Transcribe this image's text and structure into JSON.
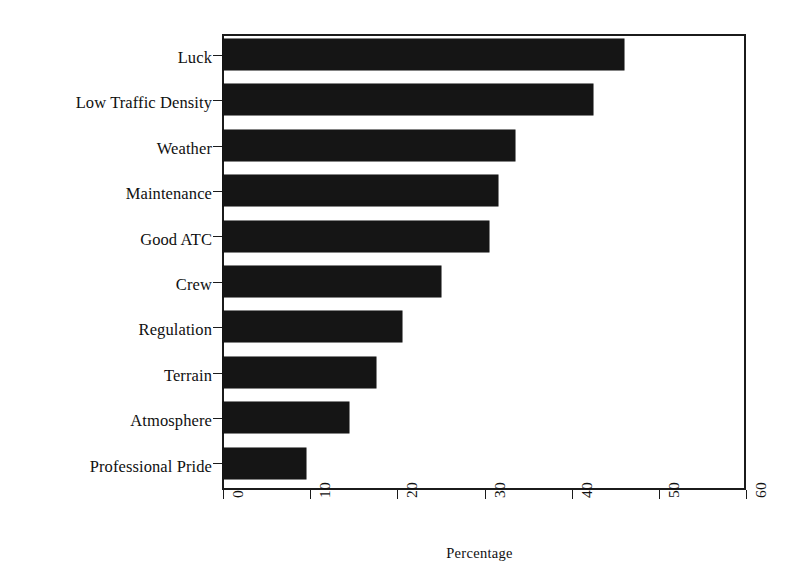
{
  "chart_data": {
    "type": "bar",
    "orientation": "horizontal",
    "title": "",
    "subtitle": "",
    "xlabel": "Percentage",
    "ylabel": "",
    "xlim": [
      0,
      60
    ],
    "xticks": [
      0,
      10,
      20,
      30,
      40,
      50,
      60
    ],
    "xticklabels": [
      "0",
      "10",
      "20",
      "30",
      "40",
      "50",
      "60"
    ],
    "grid": false,
    "legend": false,
    "bar_color": "#151515",
    "background_color": "#ffffff",
    "axis_color": "#1b1b1b",
    "categories": [
      "Luck",
      "Low Traffic Density",
      "Weather",
      "Maintenance",
      "Good ATC",
      "Crew",
      "Regulation",
      "Terrain",
      "Atmosphere",
      "Professional Pride"
    ],
    "values": [
      46,
      42.5,
      33.5,
      31.5,
      30.5,
      25,
      20.5,
      17.5,
      14.5,
      9.5
    ]
  }
}
